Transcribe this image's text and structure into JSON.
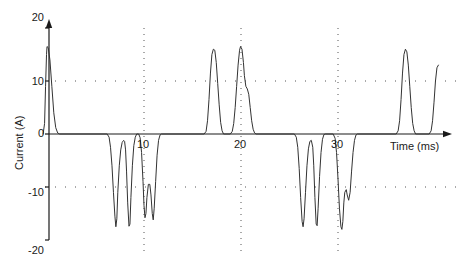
{
  "chart_data": {
    "type": "line",
    "title": "",
    "xlabel": "Time (ms)",
    "ylabel": "Current (A)",
    "xlim": [
      -0.5,
      40.5
    ],
    "ylim": [
      -20,
      20
    ],
    "grid": true,
    "grid_style": "dotted",
    "legend": "none",
    "xticks": [
      10,
      20,
      30
    ],
    "xtick_labels": [
      "10",
      "20",
      "30"
    ],
    "yticks": [
      20,
      10,
      0,
      -10,
      -20
    ],
    "ytick_labels": [
      "20",
      "10",
      "0",
      "-10",
      "-20"
    ],
    "x_gridlines": [
      10,
      20,
      30
    ],
    "y_gridlines": [
      10,
      -10
    ],
    "series": [
      {
        "name": "Current",
        "color": "#333333",
        "description": "Pulsed current waveform: bursts of narrow positive and negative spikes",
        "peaks": [
          {
            "time": 0.0,
            "current": 16.5,
            "polarity": "positive"
          },
          {
            "time": 7.0,
            "current": -17.5,
            "polarity": "negative"
          },
          {
            "time": 8.3,
            "current": -17.5,
            "polarity": "negative"
          },
          {
            "time": 10.0,
            "current": -16.0,
            "polarity": "negative"
          },
          {
            "time": 10.9,
            "current": -16.2,
            "polarity": "negative"
          },
          {
            "time": 17.2,
            "current": 16.0,
            "polarity": "positive"
          },
          {
            "time": 20.0,
            "current": 16.5,
            "polarity": "positive"
          },
          {
            "time": 26.3,
            "current": -17.5,
            "polarity": "negative"
          },
          {
            "time": 27.6,
            "current": -17.3,
            "polarity": "negative"
          },
          {
            "time": 30.3,
            "current": -18.0,
            "polarity": "negative"
          },
          {
            "time": 37.0,
            "current": 16.0,
            "polarity": "positive"
          },
          {
            "time": 40.3,
            "current": 13.0,
            "polarity": "positive"
          }
        ],
        "points": [
          [
            -0.4,
            0.0
          ],
          [
            -0.25,
            2.0
          ],
          [
            -0.15,
            9.0
          ],
          [
            -0.05,
            15.0
          ],
          [
            0.0,
            16.5
          ],
          [
            0.12,
            16.3
          ],
          [
            0.3,
            14.0
          ],
          [
            0.5,
            9.0
          ],
          [
            0.7,
            4.0
          ],
          [
            0.9,
            1.2
          ],
          [
            1.1,
            0.2
          ],
          [
            1.3,
            0.0
          ],
          [
            6.2,
            0.0
          ],
          [
            6.4,
            -0.6
          ],
          [
            6.55,
            -2.5
          ],
          [
            6.7,
            -6.0
          ],
          [
            6.85,
            -11.0
          ],
          [
            7.0,
            -15.5
          ],
          [
            7.1,
            -17.5
          ],
          [
            7.2,
            -16.0
          ],
          [
            7.3,
            -11.0
          ],
          [
            7.45,
            -6.0
          ],
          [
            7.6,
            -3.0
          ],
          [
            7.75,
            -1.6
          ],
          [
            7.9,
            -1.2
          ],
          [
            8.0,
            -1.4
          ],
          [
            8.1,
            -3.0
          ],
          [
            8.2,
            -7.0
          ],
          [
            8.32,
            -13.0
          ],
          [
            8.45,
            -17.4
          ],
          [
            8.55,
            -17.0
          ],
          [
            8.65,
            -12.0
          ],
          [
            8.8,
            -6.0
          ],
          [
            8.95,
            -2.2
          ],
          [
            9.1,
            -0.6
          ],
          [
            9.25,
            0.0
          ],
          [
            9.45,
            0.0
          ],
          [
            9.6,
            -0.7
          ],
          [
            9.75,
            -3.5
          ],
          [
            9.9,
            -9.0
          ],
          [
            10.0,
            -13.5
          ],
          [
            10.1,
            -15.8
          ],
          [
            10.2,
            -15.0
          ],
          [
            10.3,
            -12.0
          ],
          [
            10.45,
            -9.5
          ],
          [
            10.6,
            -9.5
          ],
          [
            10.72,
            -11.5
          ],
          [
            10.85,
            -15.0
          ],
          [
            10.95,
            -16.2
          ],
          [
            11.05,
            -14.0
          ],
          [
            11.2,
            -9.0
          ],
          [
            11.35,
            -4.0
          ],
          [
            11.5,
            -1.2
          ],
          [
            11.65,
            -0.2
          ],
          [
            11.8,
            0.0
          ],
          [
            16.2,
            0.0
          ],
          [
            16.4,
            0.5
          ],
          [
            16.55,
            2.5
          ],
          [
            16.7,
            6.5
          ],
          [
            16.85,
            11.5
          ],
          [
            17.0,
            15.0
          ],
          [
            17.15,
            16.0
          ],
          [
            17.3,
            15.8
          ],
          [
            17.45,
            13.5
          ],
          [
            17.6,
            9.5
          ],
          [
            17.75,
            5.5
          ],
          [
            17.9,
            2.2
          ],
          [
            18.05,
            0.6
          ],
          [
            18.2,
            0.0
          ],
          [
            18.9,
            0.0
          ],
          [
            19.1,
            0.5
          ],
          [
            19.25,
            2.0
          ],
          [
            19.4,
            5.0
          ],
          [
            19.55,
            9.0
          ],
          [
            19.7,
            13.0
          ],
          [
            19.85,
            15.8
          ],
          [
            19.95,
            16.5
          ],
          [
            20.1,
            16.0
          ],
          [
            20.25,
            13.5
          ],
          [
            20.35,
            11.0
          ],
          [
            20.5,
            9.0
          ],
          [
            20.65,
            8.5
          ],
          [
            20.8,
            7.5
          ],
          [
            20.95,
            5.0
          ],
          [
            21.1,
            2.5
          ],
          [
            21.25,
            0.9
          ],
          [
            21.4,
            0.2
          ],
          [
            21.55,
            0.0
          ],
          [
            25.5,
            0.0
          ],
          [
            25.7,
            -0.6
          ],
          [
            25.85,
            -2.5
          ],
          [
            26.0,
            -6.5
          ],
          [
            26.15,
            -12.0
          ],
          [
            26.3,
            -16.5
          ],
          [
            26.4,
            -17.5
          ],
          [
            26.5,
            -16.0
          ],
          [
            26.65,
            -11.0
          ],
          [
            26.8,
            -6.0
          ],
          [
            26.95,
            -2.8
          ],
          [
            27.1,
            -1.4
          ],
          [
            27.25,
            -1.2
          ],
          [
            27.4,
            -2.5
          ],
          [
            27.5,
            -6.0
          ],
          [
            27.62,
            -12.0
          ],
          [
            27.75,
            -17.0
          ],
          [
            27.85,
            -17.3
          ],
          [
            27.95,
            -14.0
          ],
          [
            28.1,
            -8.0
          ],
          [
            28.25,
            -3.5
          ],
          [
            28.4,
            -1.0
          ],
          [
            28.55,
            -0.1
          ],
          [
            28.7,
            0.0
          ],
          [
            29.5,
            0.0
          ],
          [
            29.7,
            -0.8
          ],
          [
            29.85,
            -3.5
          ],
          [
            30.0,
            -8.5
          ],
          [
            30.15,
            -14.0
          ],
          [
            30.3,
            -17.5
          ],
          [
            30.4,
            -18.0
          ],
          [
            30.5,
            -16.5
          ],
          [
            30.6,
            -13.0
          ],
          [
            30.7,
            -11.0
          ],
          [
            30.85,
            -10.5
          ],
          [
            30.95,
            -11.5
          ],
          [
            31.1,
            -12.5
          ],
          [
            31.25,
            -11.0
          ],
          [
            31.4,
            -7.0
          ],
          [
            31.55,
            -3.5
          ],
          [
            31.7,
            -1.2
          ],
          [
            31.85,
            -0.2
          ],
          [
            32.0,
            0.0
          ],
          [
            36.0,
            0.0
          ],
          [
            36.2,
            0.6
          ],
          [
            36.35,
            2.5
          ],
          [
            36.5,
            6.5
          ],
          [
            36.65,
            11.5
          ],
          [
            36.8,
            15.0
          ],
          [
            36.95,
            16.0
          ],
          [
            37.1,
            15.5
          ],
          [
            37.25,
            13.0
          ],
          [
            37.4,
            9.0
          ],
          [
            37.55,
            5.0
          ],
          [
            37.7,
            2.0
          ],
          [
            37.85,
            0.6
          ],
          [
            38.0,
            0.0
          ],
          [
            39.4,
            0.0
          ],
          [
            39.6,
            0.6
          ],
          [
            39.75,
            2.5
          ],
          [
            39.9,
            6.0
          ],
          [
            40.05,
            10.0
          ],
          [
            40.2,
            12.5
          ],
          [
            40.35,
            13.0
          ]
        ]
      }
    ]
  },
  "axes": {
    "y_arrow": true,
    "x_arrow": true,
    "axis_color": "#1a1a1a"
  }
}
